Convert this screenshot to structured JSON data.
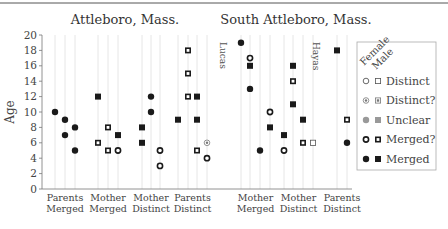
{
  "chart_data": {
    "type": "scatter",
    "ylabel": "Age",
    "ylim": [
      0,
      20
    ],
    "yticks": [
      0,
      2,
      4,
      6,
      8,
      10,
      12,
      14,
      16,
      18,
      20
    ],
    "grid": "vertical column lines",
    "legend_placement": "right",
    "legend": {
      "header": [
        "Female",
        "Male"
      ],
      "entries": [
        {
          "key": "distinct",
          "label": "Distinct"
        },
        {
          "key": "distinct_q",
          "label": "Distinct?"
        },
        {
          "key": "unclear",
          "label": "Unclear"
        },
        {
          "key": "merged_q",
          "label": "Merged?"
        },
        {
          "key": "merged",
          "label": "Merged"
        }
      ]
    },
    "panels": [
      {
        "title": "Attleboro, Mass.",
        "annotation": "Lucas",
        "groups": [
          {
            "label": [
              "Parents",
              "Merged"
            ],
            "columns": [
              [
                {
                  "age": 10,
                  "sex": "F",
                  "status": "merged"
                }
              ],
              [
                {
                  "age": 9,
                  "sex": "F",
                  "status": "merged"
                },
                {
                  "age": 7,
                  "sex": "F",
                  "status": "merged"
                }
              ],
              [
                {
                  "age": 8,
                  "sex": "F",
                  "status": "merged"
                },
                {
                  "age": 5,
                  "sex": "F",
                  "status": "merged"
                }
              ]
            ]
          },
          {
            "label": [
              "Mother",
              "Merged"
            ],
            "columns": [
              [
                {
                  "age": 12,
                  "sex": "M",
                  "status": "merged"
                },
                {
                  "age": 6,
                  "sex": "M",
                  "status": "merged_q"
                }
              ],
              [
                {
                  "age": 8,
                  "sex": "M",
                  "status": "merged_q"
                },
                {
                  "age": 5,
                  "sex": "M",
                  "status": "merged_q"
                }
              ],
              [
                {
                  "age": 7,
                  "sex": "M",
                  "status": "merged"
                },
                {
                  "age": 5,
                  "sex": "F",
                  "status": "merged_q"
                }
              ]
            ]
          },
          {
            "label": [
              "Mother",
              "Distinct"
            ],
            "columns": [
              [
                {
                  "age": 8,
                  "sex": "M",
                  "status": "merged"
                },
                {
                  "age": 6,
                  "sex": "M",
                  "status": "merged"
                }
              ],
              [
                {
                  "age": 12,
                  "sex": "F",
                  "status": "merged"
                },
                {
                  "age": 10,
                  "sex": "F",
                  "status": "merged"
                }
              ],
              [
                {
                  "age": 5,
                  "sex": "F",
                  "status": "merged_q"
                },
                {
                  "age": 3,
                  "sex": "F",
                  "status": "merged_q"
                }
              ]
            ]
          },
          {
            "label": [
              "Parents",
              "Distinct"
            ],
            "columns": [
              [
                {
                  "age": 9,
                  "sex": "M",
                  "status": "merged"
                }
              ],
              [
                {
                  "age": 18,
                  "sex": "M",
                  "status": "merged_q"
                },
                {
                  "age": 15,
                  "sex": "M",
                  "status": "merged_q"
                },
                {
                  "age": 12,
                  "sex": "M",
                  "status": "merged_q"
                }
              ],
              [
                {
                  "age": 12,
                  "sex": "M",
                  "status": "merged"
                },
                {
                  "age": 9,
                  "sex": "M",
                  "status": "merged"
                },
                {
                  "age": 5,
                  "sex": "M",
                  "status": "merged_q"
                }
              ],
              [
                {
                  "age": 6,
                  "sex": "F",
                  "status": "distinct_q"
                },
                {
                  "age": 4,
                  "sex": "F",
                  "status": "merged_q"
                }
              ]
            ]
          }
        ]
      },
      {
        "title": "South Attleboro, Mass.",
        "annotation": "Hayas",
        "groups": [
          {
            "label": [
              "Mother",
              "Merged"
            ],
            "columns": [
              [
                {
                  "age": 19,
                  "sex": "F",
                  "status": "merged"
                }
              ],
              [
                {
                  "age": 17,
                  "sex": "F",
                  "status": "merged_q"
                },
                {
                  "age": 16,
                  "sex": "M",
                  "status": "merged"
                },
                {
                  "age": 13,
                  "sex": "F",
                  "status": "merged"
                }
              ],
              [
                {
                  "age": 5,
                  "sex": "F",
                  "status": "merged"
                }
              ],
              [
                {
                  "age": 10,
                  "sex": "F",
                  "status": "merged_q"
                },
                {
                  "age": 8,
                  "sex": "M",
                  "status": "merged"
                }
              ]
            ]
          },
          {
            "label": [
              "Mother",
              "Distinct"
            ],
            "columns": [
              [
                {
                  "age": 7,
                  "sex": "M",
                  "status": "merged"
                },
                {
                  "age": 5,
                  "sex": "F",
                  "status": "merged_q"
                }
              ],
              [
                {
                  "age": 16,
                  "sex": "M",
                  "status": "merged"
                },
                {
                  "age": 14,
                  "sex": "M",
                  "status": "merged_q"
                },
                {
                  "age": 11,
                  "sex": "M",
                  "status": "merged"
                }
              ],
              [
                {
                  "age": 9,
                  "sex": "M",
                  "status": "merged"
                },
                {
                  "age": 6,
                  "sex": "M",
                  "status": "merged_q"
                }
              ],
              [
                {
                  "age": 6,
                  "sex": "M",
                  "status": "distinct"
                }
              ]
            ]
          },
          {
            "label": [
              "Parents",
              "Distinct"
            ],
            "columns": [
              [
                {
                  "age": 18,
                  "sex": "M",
                  "status": "merged"
                }
              ],
              [
                {
                  "age": 9,
                  "sex": "M",
                  "status": "merged_q"
                },
                {
                  "age": 6,
                  "sex": "F",
                  "status": "merged"
                }
              ]
            ]
          }
        ]
      }
    ]
  }
}
